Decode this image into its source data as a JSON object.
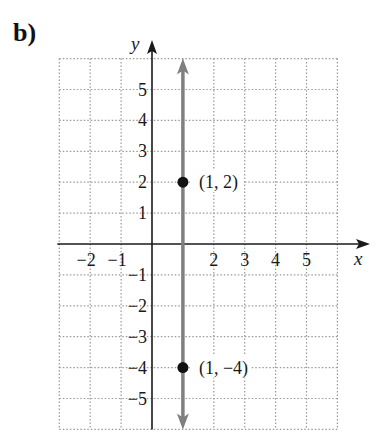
{
  "part_label": "b)",
  "chart_data": {
    "type": "line",
    "title": "",
    "xlabel": "x",
    "ylabel": "y",
    "xlim": [
      -3,
      6
    ],
    "ylim": [
      -6,
      6
    ],
    "grid": true,
    "grid_style": "dotted",
    "x_ticks": [
      -2,
      -1,
      2,
      3,
      4,
      5
    ],
    "x_tick_labels": [
      "−2",
      "−1",
      "2",
      "3",
      "4",
      "5"
    ],
    "y_ticks": [
      5,
      4,
      3,
      2,
      1,
      -1,
      -2,
      -3,
      -4,
      -5
    ],
    "y_tick_labels": [
      "5",
      "4",
      "3",
      "2",
      "1",
      "−1",
      "−2",
      "−3",
      "−4",
      "−5"
    ],
    "series": [
      {
        "name": "x = 1",
        "kind": "vertical line with arrows both ends",
        "x": [
          1,
          1
        ],
        "y": [
          -6,
          6
        ],
        "color": "#808080"
      }
    ],
    "points": [
      {
        "x": 1,
        "y": 2,
        "label": "(1, 2)"
      },
      {
        "x": 1,
        "y": -4,
        "label": "(1, −4)"
      }
    ],
    "colors": {
      "axis": "#1a1a1a",
      "line": "#808080",
      "grid": "#9a9a9a",
      "point": "#111111"
    }
  }
}
